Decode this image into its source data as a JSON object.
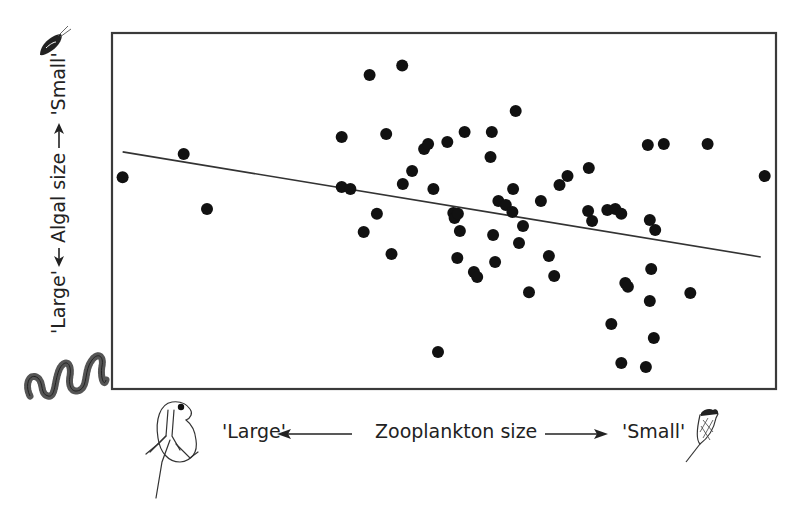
{
  "chart_data": {
    "type": "scatter",
    "title": "",
    "xlabel": "Zooplankton size",
    "ylabel": "Algal size",
    "x_axis": {
      "left_label": "'Large'",
      "right_label": "'Small'",
      "direction": "left = large zooplankton, right = small zooplankton",
      "ticks": []
    },
    "y_axis": {
      "bottom_label": "'Large'",
      "top_label": "'Small'",
      "direction": "bottom = large algae, top = small algae",
      "ticks": []
    },
    "xlim": [
      0,
      100
    ],
    "ylim": [
      0,
      100
    ],
    "grid": false,
    "legend": null,
    "plot_frame_px": {
      "left": 112,
      "top": 33,
      "right": 776,
      "bottom": 389
    },
    "series": [
      {
        "name": "observations",
        "marker": "filled-circle",
        "color": "#111111",
        "points": [
          {
            "x": 1.6,
            "y": 59.5
          },
          {
            "x": 10.8,
            "y": 66.0
          },
          {
            "x": 14.3,
            "y": 50.6
          },
          {
            "x": 34.6,
            "y": 70.8
          },
          {
            "x": 34.6,
            "y": 56.7
          },
          {
            "x": 35.9,
            "y": 56.2
          },
          {
            "x": 37.9,
            "y": 44.1
          },
          {
            "x": 38.8,
            "y": 88.2
          },
          {
            "x": 39.9,
            "y": 49.2
          },
          {
            "x": 41.3,
            "y": 71.6
          },
          {
            "x": 42.1,
            "y": 37.9
          },
          {
            "x": 43.7,
            "y": 90.9
          },
          {
            "x": 43.8,
            "y": 57.6
          },
          {
            "x": 45.2,
            "y": 61.2
          },
          {
            "x": 47.0,
            "y": 67.4
          },
          {
            "x": 47.6,
            "y": 68.8
          },
          {
            "x": 48.4,
            "y": 56.2
          },
          {
            "x": 49.1,
            "y": 10.4
          },
          {
            "x": 50.5,
            "y": 69.4
          },
          {
            "x": 51.4,
            "y": 49.4
          },
          {
            "x": 51.6,
            "y": 48.0
          },
          {
            "x": 52.0,
            "y": 36.8
          },
          {
            "x": 52.1,
            "y": 49.2
          },
          {
            "x": 52.4,
            "y": 44.4
          },
          {
            "x": 53.1,
            "y": 72.2
          },
          {
            "x": 54.5,
            "y": 32.9
          },
          {
            "x": 55.0,
            "y": 31.5
          },
          {
            "x": 57.0,
            "y": 65.2
          },
          {
            "x": 57.2,
            "y": 72.2
          },
          {
            "x": 57.4,
            "y": 43.3
          },
          {
            "x": 57.7,
            "y": 35.7
          },
          {
            "x": 58.2,
            "y": 52.8
          },
          {
            "x": 59.3,
            "y": 51.7
          },
          {
            "x": 60.3,
            "y": 49.7
          },
          {
            "x": 60.4,
            "y": 56.2
          },
          {
            "x": 60.8,
            "y": 78.1
          },
          {
            "x": 61.3,
            "y": 41.0
          },
          {
            "x": 61.9,
            "y": 45.8
          },
          {
            "x": 62.8,
            "y": 27.2
          },
          {
            "x": 64.6,
            "y": 52.8
          },
          {
            "x": 65.8,
            "y": 37.4
          },
          {
            "x": 66.6,
            "y": 31.7
          },
          {
            "x": 67.4,
            "y": 57.3
          },
          {
            "x": 68.6,
            "y": 59.8
          },
          {
            "x": 71.7,
            "y": 50.0
          },
          {
            "x": 71.8,
            "y": 62.1
          },
          {
            "x": 72.3,
            "y": 47.2
          },
          {
            "x": 74.6,
            "y": 50.3
          },
          {
            "x": 75.2,
            "y": 18.3
          },
          {
            "x": 75.8,
            "y": 50.6
          },
          {
            "x": 76.7,
            "y": 7.3
          },
          {
            "x": 76.7,
            "y": 49.2
          },
          {
            "x": 77.3,
            "y": 29.8
          },
          {
            "x": 77.7,
            "y": 28.7
          },
          {
            "x": 80.4,
            "y": 6.2
          },
          {
            "x": 80.7,
            "y": 68.5
          },
          {
            "x": 81.0,
            "y": 47.5
          },
          {
            "x": 81.0,
            "y": 24.7
          },
          {
            "x": 81.2,
            "y": 33.7
          },
          {
            "x": 81.6,
            "y": 14.3
          },
          {
            "x": 81.8,
            "y": 44.7
          },
          {
            "x": 83.1,
            "y": 68.8
          },
          {
            "x": 89.7,
            "y": 68.8
          },
          {
            "x": 87.1,
            "y": 27.0
          },
          {
            "x": 98.3,
            "y": 59.8
          }
        ]
      }
    ],
    "trendline": {
      "type": "linear",
      "color": "#333333",
      "from": {
        "x": 1.6,
        "y": 66.6
      },
      "to": {
        "x": 97.7,
        "y": 37.1
      }
    },
    "annotations": [
      {
        "text": "'Large'",
        "position": "bottom-left, left of x-axis arrow"
      },
      {
        "text": "'Small'",
        "position": "bottom-right, right of x-axis arrow"
      },
      {
        "text": "'Large'",
        "position": "left, below y-axis arrow"
      },
      {
        "text": "'Small'",
        "position": "left, above y-axis arrow"
      }
    ],
    "illustrations": [
      {
        "name": "daphnia-icon",
        "meaning": "large zooplankton"
      },
      {
        "name": "rotifer-icon",
        "meaning": "small zooplankton"
      },
      {
        "name": "filamentous-alga-icon",
        "meaning": "large algae"
      },
      {
        "name": "flagellate-alga-icon",
        "meaning": "small algae"
      }
    ]
  },
  "labels": {
    "x_left": "'Large'",
    "x_title": "Zooplankton size",
    "x_right": "'Small'",
    "y_full": "'Large' ← Algal size → 'Small'"
  }
}
